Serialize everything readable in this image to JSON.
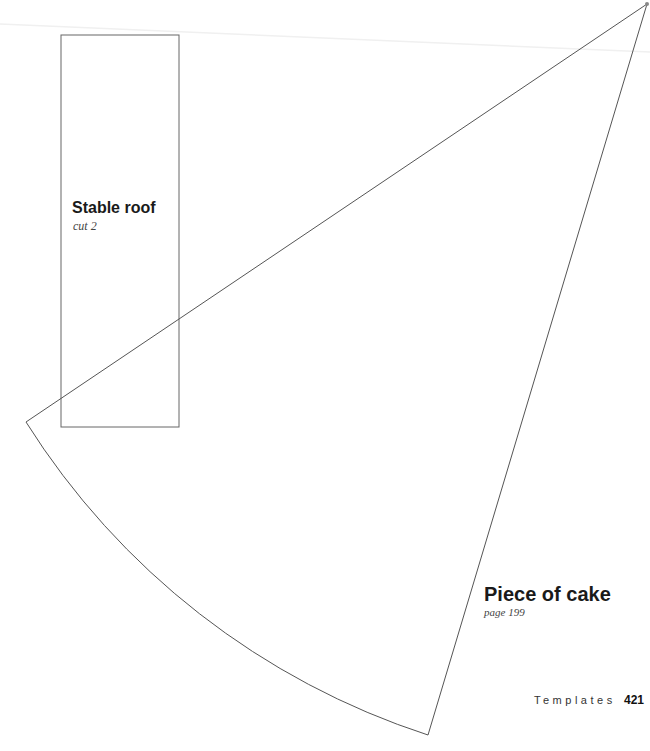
{
  "templates": [
    {
      "title": "Stable roof",
      "note": "cut 2"
    },
    {
      "title": "Piece of cake",
      "note": "page 199"
    }
  ],
  "footer": {
    "section": "Templates",
    "page_number": "421"
  }
}
